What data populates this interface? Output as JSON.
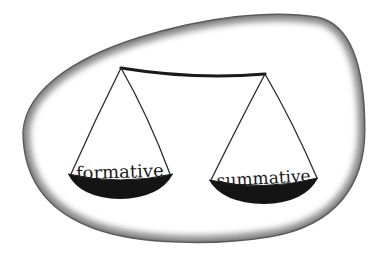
{
  "figure": {
    "left_pan": {
      "label": "formative"
    },
    "right_pan": {
      "label": "summative"
    },
    "colors": {
      "background": "#ffffff",
      "frame_shadow": "#6e6e6e",
      "ink": "#1a1a1a",
      "pan_fill": "#141414"
    }
  }
}
